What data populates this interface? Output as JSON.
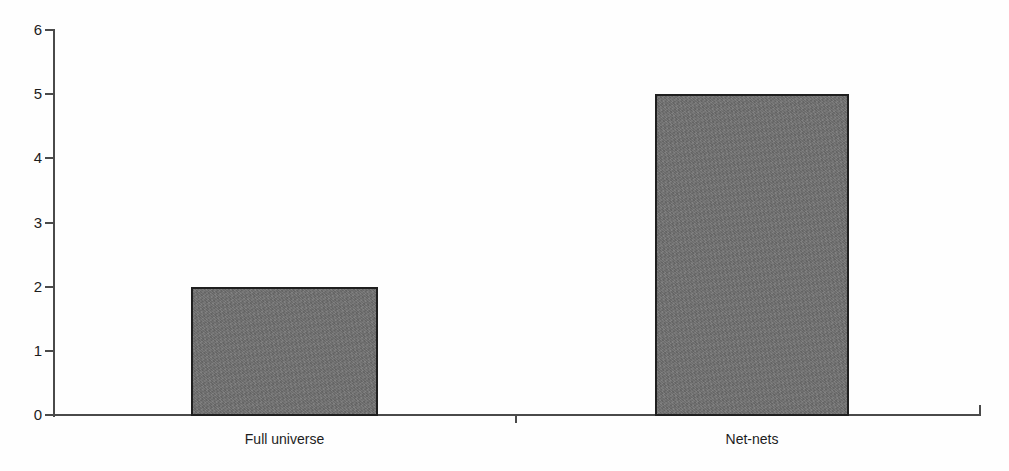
{
  "chart_data": {
    "type": "bar",
    "title": "",
    "subtitle": "",
    "xlabel": "",
    "ylabel": "",
    "categories": [
      "Full universe",
      "Net-nets"
    ],
    "values": [
      2,
      5
    ],
    "series": [
      {
        "name": "",
        "values": [
          2,
          5
        ]
      }
    ],
    "ylim": [
      0,
      6
    ],
    "yticks": [
      0,
      1,
      2,
      3,
      4,
      5,
      6
    ],
    "ytick_labels": [
      "0",
      "1",
      "2",
      "3",
      "4",
      "5",
      "6"
    ],
    "xtick_labels": [
      "Full universe",
      "Net-nets"
    ],
    "grid": false,
    "legend": null,
    "legend_position": "none",
    "annotations": [],
    "colors": {
      "bar_fill": "#6f6f6f",
      "bar_border": "#1f1f1f",
      "axis": "#4a4a4a",
      "text": "#1c1c1c",
      "background": "#fefefe"
    }
  }
}
